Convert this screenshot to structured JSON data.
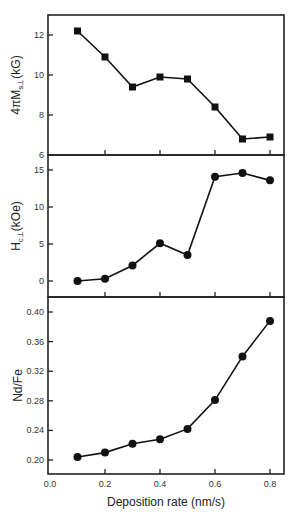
{
  "chart_data": [
    {
      "type": "line",
      "title": "",
      "xlabel": "",
      "ylabel": "4πMₛ⊥ (kG)",
      "ylabel_main": "4πM",
      "ylabel_sub": "s⊥",
      "ylabel_unit": "(kG)",
      "marker": "square",
      "x": [
        0.1,
        0.2,
        0.3,
        0.4,
        0.5,
        0.6,
        0.7,
        0.8
      ],
      "values": [
        12.2,
        10.9,
        9.4,
        9.9,
        9.8,
        8.4,
        6.8,
        6.9
      ],
      "ylim": [
        6,
        13
      ],
      "yticks": [
        "6",
        "8",
        "10",
        "12"
      ],
      "yticks_values": [
        6,
        8,
        10,
        12
      ],
      "grid": false
    },
    {
      "type": "line",
      "title": "",
      "xlabel": "",
      "ylabel": "Hᴄ⊥ (kOe)",
      "ylabel_main": "H",
      "ylabel_sub": "c⊥",
      "ylabel_unit": "(kOe)",
      "marker": "circle",
      "x": [
        0.1,
        0.2,
        0.3,
        0.4,
        0.5,
        0.6,
        0.7,
        0.8
      ],
      "values": [
        0.0,
        0.3,
        2.1,
        5.1,
        3.5,
        14.1,
        14.6,
        13.6
      ],
      "ylim": [
        -2.2,
        16.5
      ],
      "yticks": [
        "0",
        "5",
        "10",
        "15"
      ],
      "yticks_values": [
        0,
        5,
        10,
        15
      ],
      "grid": false
    },
    {
      "type": "line",
      "title": "",
      "xlabel": "Deposition rate (nm/s)",
      "ylabel": "Nd/Fe",
      "marker": "circle",
      "x": [
        0.1,
        0.2,
        0.3,
        0.4,
        0.5,
        0.6,
        0.7,
        0.8
      ],
      "values": [
        0.204,
        0.21,
        0.222,
        0.228,
        0.242,
        0.281,
        0.34,
        0.388
      ],
      "ylim": [
        0.18,
        0.42
      ],
      "yticks": [
        "0.20",
        "0.24",
        "0.28",
        "0.32",
        "0.36",
        "0.40"
      ],
      "yticks_values": [
        0.2,
        0.24,
        0.28,
        0.32,
        0.36,
        0.4
      ],
      "xticks": [
        "0.0",
        "0.2",
        "0.4",
        "0.6",
        "0.8"
      ],
      "xticks_values": [
        0.0,
        0.2,
        0.4,
        0.6,
        0.8
      ],
      "xlim": [
        0.0,
        0.85
      ],
      "grid": false
    }
  ]
}
